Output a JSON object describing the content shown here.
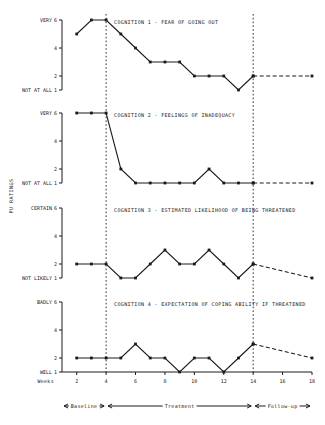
{
  "figure": {
    "ylabel": "PU RATINGS",
    "xlabel": "Weeks",
    "x_ticks": [
      2,
      4,
      6,
      8,
      10,
      12,
      14,
      16,
      18
    ],
    "xlim": [
      1,
      18
    ],
    "phase_lines_at_weeks": [
      4,
      14
    ],
    "phases": [
      {
        "label": "Baseline",
        "start": 1,
        "end": 4
      },
      {
        "label": "Treatment",
        "start": 4,
        "end": 14
      },
      {
        "label": "Follow-up",
        "start": 14,
        "end": 18
      }
    ]
  },
  "chart_data": [
    {
      "type": "line",
      "title": "COGNITION 1 - FEAR OF GOING OUT",
      "xlabel": "Weeks",
      "ylabel": "PU RATINGS",
      "ylim": [
        1,
        6
      ],
      "y_ticks": [
        1,
        2,
        4,
        6
      ],
      "y_tick_labels": [
        "1",
        "2",
        "4",
        "6"
      ],
      "y_top_label": "VERY",
      "y_bottom_label": "NOT AT ALL",
      "x": [
        2,
        3,
        4,
        5,
        6,
        7,
        8,
        9,
        10,
        11,
        12,
        13,
        14
      ],
      "values": [
        5,
        6,
        6,
        5,
        4,
        3,
        3,
        3,
        2,
        2,
        2,
        1,
        2
      ],
      "followup_x": [
        14,
        18
      ],
      "followup_values": [
        2,
        2
      ]
    },
    {
      "type": "line",
      "title": "COGNITION 2 - FEELINGS OF INADEQUACY",
      "xlabel": "Weeks",
      "ylabel": "PU RATINGS",
      "ylim": [
        1,
        6
      ],
      "y_ticks": [
        1,
        2,
        4,
        6
      ],
      "y_tick_labels": [
        "1",
        "2",
        "4",
        "6"
      ],
      "y_top_label": "VERY",
      "y_bottom_label": "NOT AT ALL",
      "x": [
        2,
        3,
        4,
        5,
        6,
        7,
        8,
        9,
        10,
        11,
        12,
        13,
        14
      ],
      "values": [
        6,
        6,
        6,
        2,
        1,
        1,
        1,
        1,
        1,
        2,
        1,
        1,
        1
      ],
      "followup_x": [
        14,
        18
      ],
      "followup_values": [
        1,
        1
      ]
    },
    {
      "type": "line",
      "title": "COGNITION 3 - ESTIMATED LIKELIHOOD OF BEING THREATENED",
      "xlabel": "Weeks",
      "ylabel": "PU RATINGS",
      "ylim": [
        1,
        6
      ],
      "y_ticks": [
        1,
        2,
        4,
        6
      ],
      "y_tick_labels": [
        "1",
        "2",
        "4",
        "6"
      ],
      "y_top_label": "CERTAIN",
      "y_bottom_label": "NOT LIKELY",
      "x": [
        2,
        3,
        4,
        5,
        6,
        7,
        8,
        9,
        10,
        11,
        12,
        13,
        14
      ],
      "values": [
        2,
        2,
        2,
        1,
        1,
        2,
        3,
        2,
        2,
        3,
        2,
        1,
        2
      ],
      "followup_x": [
        14,
        18
      ],
      "followup_values": [
        2,
        1
      ]
    },
    {
      "type": "line",
      "title": "COGNITION 4 - EXPECTATION OF COPING ABILITY IF THREATENED",
      "xlabel": "Weeks",
      "ylabel": "PU RATINGS",
      "ylim": [
        1,
        6
      ],
      "y_ticks": [
        1,
        2,
        4,
        6
      ],
      "y_tick_labels": [
        "1",
        "2",
        "4",
        "6"
      ],
      "y_top_label": "BADLY",
      "y_bottom_label": "WELL",
      "x": [
        2,
        3,
        4,
        5,
        6,
        7,
        8,
        9,
        10,
        11,
        12,
        13,
        14
      ],
      "values": [
        2,
        2,
        2,
        2,
        3,
        2,
        2,
        1,
        2,
        2,
        1,
        2,
        3
      ],
      "followup_x": [
        14,
        18
      ],
      "followup_values": [
        3,
        2
      ]
    }
  ]
}
